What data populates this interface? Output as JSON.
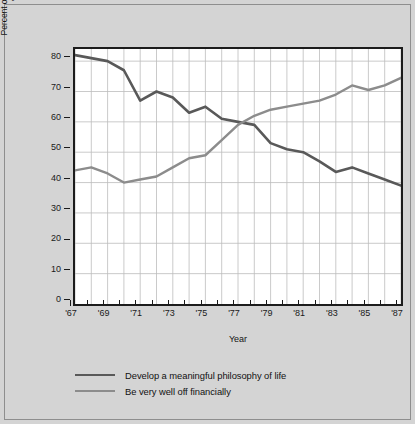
{
  "chart_data": {
    "type": "line",
    "title": "",
    "xlabel": "Year",
    "ylabel_line1": "Percent of freshmen who identified each goal as",
    "ylabel_line2": "\"essential\" or \"very important\"",
    "x": [
      1967,
      1968,
      1969,
      1970,
      1971,
      1972,
      1973,
      1974,
      1975,
      1976,
      1977,
      1978,
      1979,
      1980,
      1981,
      1982,
      1983,
      1984,
      1985,
      1986,
      1987
    ],
    "xtick_labels": [
      "'67",
      "'69",
      "'71",
      "'73",
      "'75",
      "'77",
      "'79",
      "'81",
      "'83",
      "'85",
      "'87"
    ],
    "xtick_values": [
      1967,
      1969,
      1971,
      1973,
      1975,
      1977,
      1979,
      1981,
      1983,
      1985,
      1987
    ],
    "ytick_labels": [
      "0",
      "10",
      "20",
      "30",
      "40",
      "50",
      "60",
      "70",
      "80"
    ],
    "ytick_values": [
      0,
      10,
      20,
      30,
      40,
      50,
      60,
      70,
      80
    ],
    "xlim": [
      1967,
      1987
    ],
    "ylim": [
      0,
      84
    ],
    "grid": true,
    "grid_color": "#bdbdbd",
    "legend_position": "below",
    "series": [
      {
        "name": "Develop a meaningful philosophy of life",
        "color": "#595959",
        "width": 2.6,
        "values": [
          82,
          81,
          80,
          77,
          67,
          70,
          68,
          63,
          65,
          61,
          60,
          59,
          53,
          51,
          50,
          47,
          43.5,
          45,
          43,
          41,
          39
        ]
      },
      {
        "name": "Be very well off financially",
        "color": "#8c8c8c",
        "width": 2.4,
        "values": [
          44,
          45,
          43,
          40,
          41,
          42,
          45,
          48,
          49,
          54,
          59,
          62,
          64,
          65,
          66,
          67,
          69,
          72,
          70.5,
          72,
          74.5
        ]
      }
    ]
  },
  "colors": {
    "page_background": "#d4d4d4",
    "plot_background": "#ffffff",
    "axis": "#1c1c1c",
    "text": "#141414",
    "series_dark": "#595959",
    "series_light": "#8c8c8c"
  }
}
